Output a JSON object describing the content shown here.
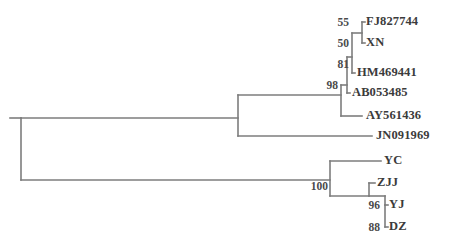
{
  "figure": {
    "type": "phylogenetic-tree",
    "layout": "rectangular-cladogram",
    "background_color": "#ffffff",
    "branch_color": "#7d7d7d",
    "label_color": "#3b3b3b",
    "support_color": "#4a4a4a"
  },
  "taxa": [
    {
      "id": "FJ827744",
      "label": "FJ827744",
      "x": 366,
      "y": 22
    },
    {
      "id": "XN",
      "label": "XN",
      "x": 366,
      "y": 43
    },
    {
      "id": "HM469441",
      "label": "HM469441",
      "x": 357,
      "y": 73
    },
    {
      "id": "AB053485",
      "label": "AB053485",
      "x": 352,
      "y": 93
    },
    {
      "id": "AY561436",
      "label": "AY561436",
      "x": 366,
      "y": 116
    },
    {
      "id": "JN091969",
      "label": "JN091969",
      "x": 376,
      "y": 136
    },
    {
      "id": "YC",
      "label": "YC",
      "x": 384,
      "y": 161
    },
    {
      "id": "ZJJ",
      "label": "ZJJ",
      "x": 377,
      "y": 183
    },
    {
      "id": "YJ",
      "label": "YJ",
      "x": 389,
      "y": 205
    },
    {
      "id": "DZ",
      "label": "DZ",
      "x": 389,
      "y": 227
    }
  ],
  "support_values": [
    {
      "id": "node-55",
      "value": "55",
      "x": 329,
      "y": 23
    },
    {
      "id": "node-50",
      "value": "50",
      "x": 329,
      "y": 44
    },
    {
      "id": "node-81",
      "value": "81",
      "x": 329,
      "y": 65
    },
    {
      "id": "node-98",
      "value": "98",
      "x": 323,
      "y": 86
    },
    {
      "id": "node-100",
      "value": "100",
      "x": 303,
      "y": 186
    },
    {
      "id": "node-96",
      "value": "96",
      "x": 357,
      "y": 206
    },
    {
      "id": "node-88",
      "value": "88",
      "x": 357,
      "y": 228
    }
  ],
  "branches": {
    "root_x": 21,
    "root_top_y": 118,
    "root_bottom_y": 180,
    "root_stub_x": 10,
    "upper_node_x": 238,
    "upper_clade_y": 95,
    "jn_branch_y": 136,
    "jn_branch_end_x": 372,
    "node98_x": 341,
    "node81_x": 347,
    "node50_x": 352,
    "node55_x": 362,
    "node100_x": 330,
    "node96_x": 385,
    "zjj_node_x": 369
  }
}
